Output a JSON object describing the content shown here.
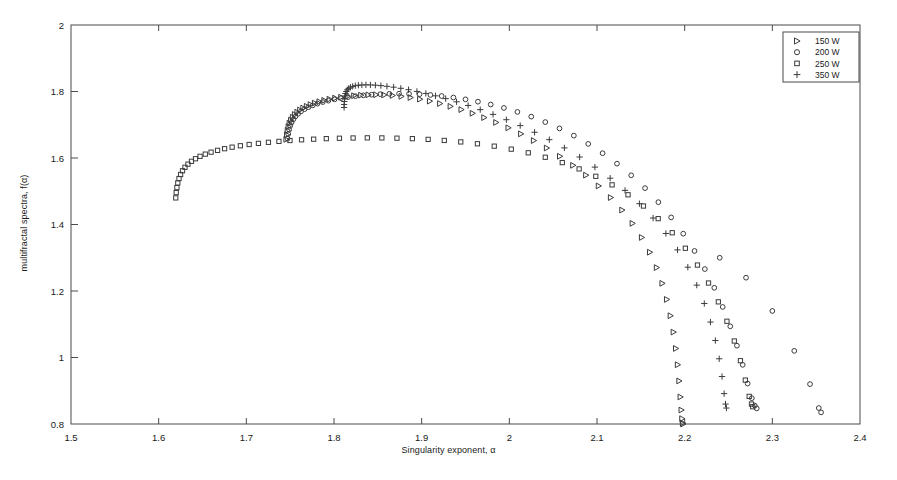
{
  "figure": {
    "background": "#ffffff",
    "frame_color": "#4a4a4a",
    "marker_color": "#3b3b3b"
  },
  "chart_data": {
    "type": "scatter",
    "title": "",
    "xlabel": "Singularity exponent, α",
    "ylabel": "multifractal spectra, f(α)",
    "xlim": [
      1.5,
      2.4
    ],
    "ylim": [
      0.8,
      2.0
    ],
    "xticks": [
      1.5,
      1.6,
      1.7,
      1.8,
      1.9,
      2.0,
      2.1,
      2.2,
      2.3,
      2.4
    ],
    "xticklabels": [
      "1.5",
      "1.6",
      "1.7",
      "1.8",
      "1.9",
      "2",
      "2.1",
      "2.2",
      "2.3",
      "2.4"
    ],
    "yticks": [
      0.8,
      1.0,
      1.2,
      1.4,
      1.6,
      1.8,
      2.0
    ],
    "yticklabels": [
      "0.8",
      "1",
      "1.2",
      "1.4",
      "1.6",
      "1.8",
      "2"
    ],
    "grid": false,
    "legend_position": "top-right",
    "series": [
      {
        "name": "150 W",
        "marker": "triangle-right",
        "points": [
          [
            1.7455,
            1.656
          ],
          [
            1.7462,
            1.67
          ],
          [
            1.747,
            1.683
          ],
          [
            1.748,
            1.6945
          ],
          [
            1.7492,
            1.7045
          ],
          [
            1.7508,
            1.714
          ],
          [
            1.7528,
            1.7228
          ],
          [
            1.7552,
            1.7308
          ],
          [
            1.758,
            1.738
          ],
          [
            1.7612,
            1.7444
          ],
          [
            1.7648,
            1.7502
          ],
          [
            1.7688,
            1.7556
          ],
          [
            1.7732,
            1.7606
          ],
          [
            1.778,
            1.7652
          ],
          [
            1.7832,
            1.7694
          ],
          [
            1.7888,
            1.7734
          ],
          [
            1.7948,
            1.777
          ],
          [
            1.8012,
            1.7802
          ],
          [
            1.808,
            1.783
          ],
          [
            1.8152,
            1.7854
          ],
          [
            1.8228,
            1.7874
          ],
          [
            1.8308,
            1.789
          ],
          [
            1.8392,
            1.79
          ],
          [
            1.848,
            1.7902
          ],
          [
            1.8572,
            1.7896
          ],
          [
            1.8668,
            1.788
          ],
          [
            1.8768,
            1.7854
          ],
          [
            1.8872,
            1.7818
          ],
          [
            1.898,
            1.777
          ],
          [
            1.9092,
            1.771
          ],
          [
            1.9208,
            1.7638
          ],
          [
            1.9328,
            1.7554
          ],
          [
            1.9452,
            1.7456
          ],
          [
            1.958,
            1.7344
          ],
          [
            1.9712,
            1.7216
          ],
          [
            1.9848,
            1.707
          ],
          [
            1.9988,
            1.6908
          ],
          [
            2.0132,
            1.6726
          ],
          [
            2.0278,
            1.6524
          ],
          [
            2.0426,
            1.63
          ],
          [
            2.0576,
            1.6052
          ],
          [
            2.0726,
            1.578
          ],
          [
            2.0874,
            1.5484
          ],
          [
            2.1018,
            1.516
          ],
          [
            2.1156,
            1.481
          ],
          [
            2.1286,
            1.4434
          ],
          [
            2.1404,
            1.4034
          ],
          [
            2.151,
            1.361
          ],
          [
            2.1602,
            1.3166
          ],
          [
            2.168,
            1.2704
          ],
          [
            2.1744,
            1.223
          ],
          [
            2.1796,
            1.1746
          ],
          [
            2.1838,
            1.1256
          ],
          [
            2.1872,
            1.0764
          ],
          [
            2.1899,
            1.0272
          ],
          [
            2.192,
            0.9782
          ],
          [
            2.1937,
            0.9296
          ],
          [
            2.1951,
            0.8814
          ],
          [
            2.1962,
            0.842
          ],
          [
            2.197,
            0.816
          ],
          [
            2.1977,
            0.803
          ],
          [
            2.1982,
            0.8
          ]
        ]
      },
      {
        "name": "200 W",
        "marker": "circle",
        "points": [
          [
            1.747,
            1.658
          ],
          [
            1.7478,
            1.672
          ],
          [
            1.7488,
            1.685
          ],
          [
            1.75,
            1.6965
          ],
          [
            1.7516,
            1.7068
          ],
          [
            1.7536,
            1.7162
          ],
          [
            1.756,
            1.725
          ],
          [
            1.759,
            1.733
          ],
          [
            1.7624,
            1.7402
          ],
          [
            1.7664,
            1.7468
          ],
          [
            1.7708,
            1.7528
          ],
          [
            1.7758,
            1.7584
          ],
          [
            1.7812,
            1.7634
          ],
          [
            1.7872,
            1.7682
          ],
          [
            1.7936,
            1.7724
          ],
          [
            1.8006,
            1.7764
          ],
          [
            1.808,
            1.78
          ],
          [
            1.816,
            1.7832
          ],
          [
            1.8244,
            1.786
          ],
          [
            1.8334,
            1.7884
          ],
          [
            1.8428,
            1.7904
          ],
          [
            1.8528,
            1.792
          ],
          [
            1.8632,
            1.793
          ],
          [
            1.8742,
            1.7934
          ],
          [
            1.8856,
            1.793
          ],
          [
            1.8976,
            1.7918
          ],
          [
            1.91,
            1.7896
          ],
          [
            1.9228,
            1.7864
          ],
          [
            1.9362,
            1.782
          ],
          [
            1.95,
            1.7764
          ],
          [
            1.9642,
            1.7694
          ],
          [
            1.9788,
            1.7608
          ],
          [
            1.9938,
            1.7506
          ],
          [
            2.0092,
            1.7386
          ],
          [
            2.025,
            1.7244
          ],
          [
            2.041,
            1.708
          ],
          [
            2.0572,
            1.689
          ],
          [
            2.0736,
            1.6672
          ],
          [
            2.09,
            1.6424
          ],
          [
            2.1064,
            1.6144
          ],
          [
            2.1228,
            1.583
          ],
          [
            2.139,
            1.548
          ],
          [
            2.1548,
            1.5094
          ],
          [
            2.17,
            1.4672
          ],
          [
            2.1846,
            1.4214
          ],
          [
            2.1984,
            1.3724
          ],
          [
            2.2112,
            1.3204
          ],
          [
            2.223,
            1.266
          ],
          [
            2.2338,
            1.2096
          ],
          [
            2.2434,
            1.152
          ],
          [
            2.252,
            1.0938
          ],
          [
            2.2596,
            1.0356
          ],
          [
            2.2662,
            0.978
          ],
          [
            2.2718,
            0.9216
          ],
          [
            2.2766,
            0.8776
          ],
          [
            2.28,
            0.8554
          ],
          [
            2.2822,
            0.847
          ]
        ],
        "note": "rightmost descending branch reaching x=2.355 for upper circle locus",
        "points_extended": [
          [
            2.24,
            1.3
          ],
          [
            2.27,
            1.24
          ],
          [
            2.3,
            1.14
          ],
          [
            2.325,
            1.02
          ],
          [
            2.343,
            0.92
          ],
          [
            2.353,
            0.848
          ],
          [
            2.3556,
            0.835
          ]
        ]
      },
      {
        "name": "250 W",
        "marker": "square",
        "points": [
          [
            1.6195,
            1.48
          ],
          [
            1.62,
            1.496
          ],
          [
            1.6208,
            1.511
          ],
          [
            1.6218,
            1.525
          ],
          [
            1.6232,
            1.5382
          ],
          [
            1.625,
            1.5504
          ],
          [
            1.6272,
            1.5616
          ],
          [
            1.63,
            1.572
          ],
          [
            1.6334,
            1.5814
          ],
          [
            1.6374,
            1.59
          ],
          [
            1.642,
            1.5978
          ],
          [
            1.6472,
            1.605
          ],
          [
            1.6532,
            1.6116
          ],
          [
            1.6598,
            1.6176
          ],
          [
            1.6672,
            1.623
          ],
          [
            1.6752,
            1.628
          ],
          [
            1.6838,
            1.6326
          ],
          [
            1.6932,
            1.6368
          ],
          [
            1.7032,
            1.6406
          ],
          [
            1.7138,
            1.644
          ],
          [
            1.7252,
            1.6472
          ],
          [
            1.7372,
            1.65
          ],
          [
            1.7498,
            1.6526
          ],
          [
            1.763,
            1.6548
          ],
          [
            1.7768,
            1.6566
          ],
          [
            1.7912,
            1.6582
          ],
          [
            1.8062,
            1.6594
          ],
          [
            1.8218,
            1.6602
          ],
          [
            1.838,
            1.6606
          ],
          [
            1.8546,
            1.6604
          ],
          [
            1.8718,
            1.6596
          ],
          [
            1.8894,
            1.6582
          ],
          [
            1.9074,
            1.656
          ],
          [
            1.9258,
            1.6528
          ],
          [
            1.9446,
            1.6484
          ],
          [
            1.9636,
            1.6428
          ],
          [
            1.9828,
            1.6356
          ],
          [
            2.0022,
            1.6266
          ],
          [
            2.0216,
            1.6156
          ],
          [
            2.041,
            1.6022
          ],
          [
            2.0604,
            1.5862
          ],
          [
            2.0796,
            1.5672
          ],
          [
            2.0986,
            1.545
          ],
          [
            2.1172,
            1.5192
          ],
          [
            2.1354,
            1.4894
          ],
          [
            2.153,
            1.4556
          ],
          [
            2.1698,
            1.4176
          ],
          [
            2.1858,
            1.3752
          ],
          [
            2.2008,
            1.3286
          ],
          [
            2.2146,
            1.278
          ],
          [
            2.2272,
            1.224
          ],
          [
            2.2384,
            1.1674
          ],
          [
            2.2482,
            1.109
          ],
          [
            2.2566,
            1.0496
          ],
          [
            2.2636,
            0.9904
          ],
          [
            2.2692,
            0.932
          ],
          [
            2.2736,
            0.883
          ],
          [
            2.2762,
            0.86
          ],
          [
            2.2776,
            0.852
          ]
        ]
      },
      {
        "name": "350 W",
        "marker": "plus",
        "points": [
          [
            1.8115,
            1.752
          ],
          [
            1.8116,
            1.761
          ],
          [
            1.8118,
            1.77
          ],
          [
            1.8121,
            1.7786
          ],
          [
            1.8125,
            1.7866
          ],
          [
            1.8131,
            1.7938
          ],
          [
            1.814,
            1.8
          ],
          [
            1.8152,
            1.8052
          ],
          [
            1.8168,
            1.8094
          ],
          [
            1.8188,
            1.8128
          ],
          [
            1.8213,
            1.8154
          ],
          [
            1.8243,
            1.8174
          ],
          [
            1.8278,
            1.8188
          ],
          [
            1.8318,
            1.8196
          ],
          [
            1.8364,
            1.82
          ],
          [
            1.8415,
            1.8198
          ],
          [
            1.8472,
            1.819
          ],
          [
            1.8535,
            1.8176
          ],
          [
            1.8604,
            1.8156
          ],
          [
            1.868,
            1.813
          ],
          [
            1.8762,
            1.8096
          ],
          [
            1.885,
            1.8054
          ],
          [
            1.8946,
            1.8002
          ],
          [
            1.9048,
            1.7942
          ],
          [
            1.9158,
            1.787
          ],
          [
            1.9274,
            1.7786
          ],
          [
            1.9398,
            1.769
          ],
          [
            1.953,
            1.758
          ],
          [
            1.9668,
            1.7454
          ],
          [
            1.9814,
            1.7312
          ],
          [
            1.9966,
            1.7152
          ],
          [
            2.0124,
            1.6974
          ],
          [
            2.0288,
            1.6774
          ],
          [
            2.0456,
            1.6552
          ],
          [
            2.0628,
            1.6304
          ],
          [
            2.0802,
            1.603
          ],
          [
            2.0976,
            1.5726
          ],
          [
            2.115,
            1.5392
          ],
          [
            2.132,
            1.5026
          ],
          [
            2.1484,
            1.4626
          ],
          [
            2.164,
            1.4194
          ],
          [
            2.1786,
            1.373
          ],
          [
            2.1918,
            1.3236
          ],
          [
            2.2036,
            1.2716
          ],
          [
            2.2138,
            1.2176
          ],
          [
            2.2224,
            1.1624
          ],
          [
            2.2294,
            1.1066
          ],
          [
            2.235,
            1.051
          ],
          [
            2.2394,
            0.9962
          ],
          [
            2.2426,
            0.9428
          ],
          [
            2.245,
            0.8914
          ],
          [
            2.2466,
            0.86
          ],
          [
            2.2476,
            0.848
          ]
        ]
      }
    ],
    "legend_entries": [
      {
        "label": "150 W",
        "marker": "triangle-right"
      },
      {
        "label": "200 W",
        "marker": "circle"
      },
      {
        "label": "250 W",
        "marker": "square"
      },
      {
        "label": "350 W",
        "marker": "plus"
      }
    ]
  }
}
